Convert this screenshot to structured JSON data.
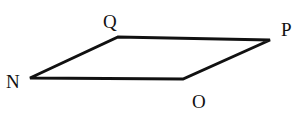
{
  "diagram": {
    "type": "parallelogram",
    "vertices": [
      {
        "name": "N",
        "x": 30,
        "y": 78,
        "label_x": 6,
        "label_y": 88
      },
      {
        "name": "Q",
        "x": 118,
        "y": 37,
        "label_x": 103,
        "label_y": 28
      },
      {
        "name": "P",
        "x": 270,
        "y": 40,
        "label_x": 281,
        "label_y": 36
      },
      {
        "name": "O",
        "x": 183,
        "y": 79,
        "label_x": 192,
        "label_y": 108
      }
    ],
    "labels": {
      "n": "N",
      "q": "Q",
      "p": "P",
      "o": "O"
    },
    "stroke_color": "#111111"
  }
}
